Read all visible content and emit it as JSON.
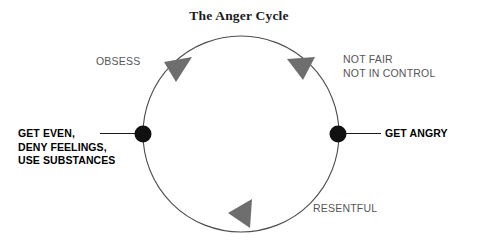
{
  "title": "The Anger Cycle",
  "diagram": {
    "type": "cycle",
    "direction": "clockwise",
    "circle": {
      "cx": 241,
      "cy": 134,
      "r": 98,
      "stroke": "#4d4d4d"
    },
    "node_color": "#111111",
    "arrow_color": "#6e6e6e",
    "stage_text_color": "#565656",
    "node_text_color": "#000000",
    "nodes": [
      {
        "name": "get-even",
        "lines": [
          "GET EVEN,",
          "DENY FEELINGS,",
          "USE SUBSTANCES"
        ],
        "position": "left"
      },
      {
        "name": "get-angry",
        "lines": [
          "GET ANGRY"
        ],
        "position": "right"
      }
    ],
    "stages": [
      {
        "name": "obsess",
        "lines": [
          "OBSESS"
        ],
        "position": "top-left"
      },
      {
        "name": "not-fair",
        "lines": [
          "NOT FAIR",
          "NOT IN CONTROL"
        ],
        "position": "top-right"
      },
      {
        "name": "resentful",
        "lines": [
          "RESENTFUL"
        ],
        "position": "bottom-right"
      }
    ],
    "arrows": [
      {
        "name": "arrow-top-left",
        "points_toward": "top"
      },
      {
        "name": "arrow-top-right",
        "points_toward": "right"
      },
      {
        "name": "arrow-bottom",
        "points_toward": "left"
      }
    ]
  }
}
